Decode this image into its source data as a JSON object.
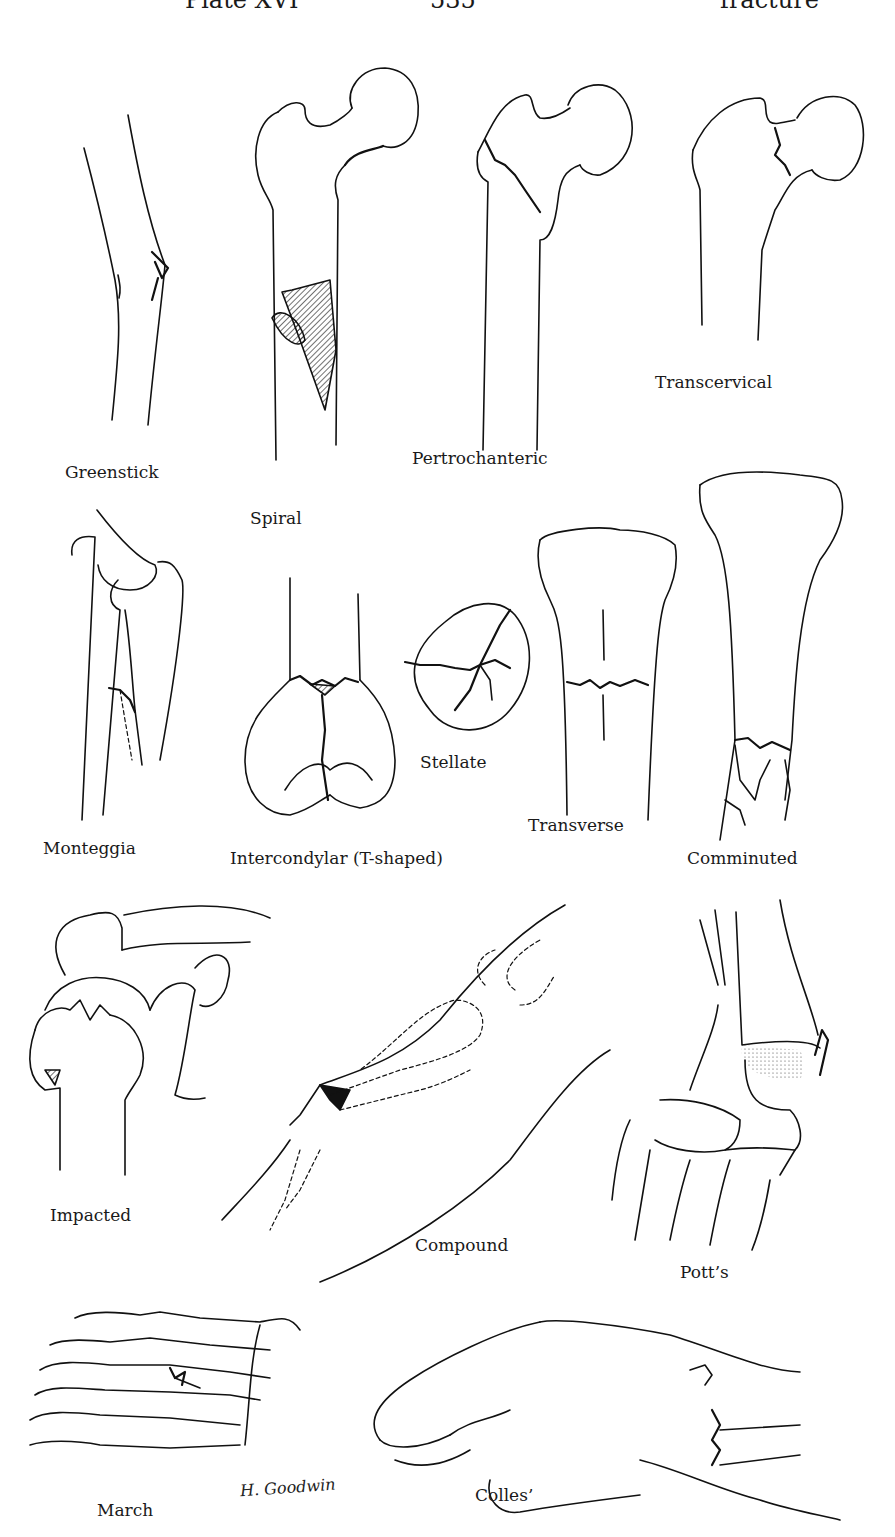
{
  "header": {
    "left": "Plate XVI",
    "center": "535",
    "right": "fracture"
  },
  "figures": [
    {
      "id": "greenstick",
      "label": "Greenstick"
    },
    {
      "id": "spiral",
      "label": "Spiral"
    },
    {
      "id": "pertrochanteric",
      "label": "Pertrochanteric"
    },
    {
      "id": "transcervical",
      "label": "Transcervical"
    },
    {
      "id": "monteggia",
      "label": "Monteggia"
    },
    {
      "id": "intercondylar",
      "label": "Intercondylar (T-shaped)"
    },
    {
      "id": "stellate",
      "label": "Stellate"
    },
    {
      "id": "transverse",
      "label": "Transverse"
    },
    {
      "id": "comminuted",
      "label": "Comminuted"
    },
    {
      "id": "impacted",
      "label": "Impacted"
    },
    {
      "id": "compound",
      "label": "Compound"
    },
    {
      "id": "potts",
      "label": "Pott’s"
    },
    {
      "id": "march",
      "label": "March"
    },
    {
      "id": "colles",
      "label": "Colles’"
    }
  ],
  "signature": "H. Goodwin"
}
